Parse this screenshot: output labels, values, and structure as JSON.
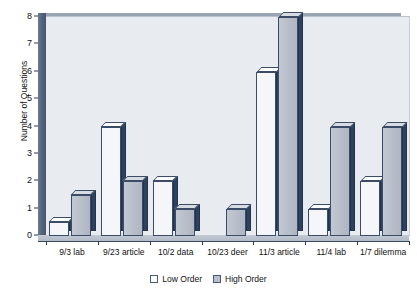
{
  "chart_data": {
    "type": "bar",
    "title": "",
    "xlabel": "",
    "ylabel": "Number of Questions",
    "ylim": [
      0,
      8
    ],
    "yticks": [
      0,
      1,
      2,
      3,
      4,
      5,
      6,
      7,
      8
    ],
    "ytick_labels": [
      "0",
      "1",
      "2",
      "3",
      "4",
      "5",
      "6",
      "7",
      "8"
    ],
    "grid": false,
    "legend_position": "bottom",
    "style": "3d-column",
    "categories": [
      "9/3 lab",
      "9/23 article",
      "10/2 data",
      "10/23 deer",
      "11/3 article",
      "11/4 lab",
      "1/7 dilemma"
    ],
    "series": [
      {
        "name": "Low Order",
        "color": "#f4f6f9",
        "values": [
          0.5,
          4,
          2,
          0,
          6,
          1,
          2
        ]
      },
      {
        "name": "High Order",
        "color": "#b9c0ca",
        "values": [
          1.5,
          2,
          1,
          1,
          8,
          4,
          4
        ]
      }
    ]
  },
  "axes": {
    "y_title": "Number of Questions"
  },
  "legend": {
    "entries": [
      {
        "label": "Low Order",
        "swatch": "low"
      },
      {
        "label": "High Order",
        "swatch": "high"
      }
    ]
  },
  "colors": {
    "plot_background": "#e8ecf1",
    "wall_navy": "#55647f",
    "bar_side_navy": "#2e4260",
    "bar_low_face": "#f4f6f9",
    "bar_high_face": "#b9c0ca",
    "axis_line": "#2c3a52",
    "text": "#111111"
  }
}
